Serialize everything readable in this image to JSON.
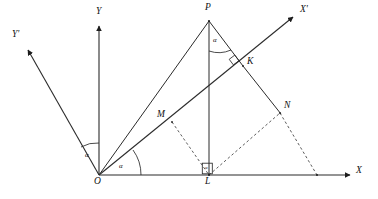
{
  "figure": {
    "type": "geometry-diagram",
    "background_color": "#ffffff",
    "line_color": "#2b2b2b",
    "dashed_color": "#4a4a4a"
  },
  "axes": [
    {
      "id": "x-axis",
      "label": "X",
      "from": [
        99,
        175
      ],
      "to": [
        352,
        175
      ]
    },
    {
      "id": "y-axis",
      "label": "Y",
      "from": [
        99,
        175
      ],
      "to": [
        99,
        24
      ]
    },
    {
      "id": "x-prime-axis",
      "label": "X'",
      "from": [
        99,
        175
      ],
      "to": [
        294,
        16
      ]
    },
    {
      "id": "y-prime-axis",
      "label": "Y'",
      "from": [
        99,
        175
      ],
      "to": [
        27,
        49
      ]
    }
  ],
  "axis_labels": [
    {
      "name": "x-axis-label",
      "text": "X",
      "x": 356,
      "y": 167
    },
    {
      "name": "y-axis-label",
      "text": "Y",
      "x": 96,
      "y": 8
    },
    {
      "name": "x-prime-axis-label",
      "text": "X'",
      "x": 300,
      "y": 6
    },
    {
      "name": "y-prime-axis-label",
      "text": "Y'",
      "x": 12,
      "y": 31
    }
  ],
  "points": [
    {
      "name": "point-O",
      "label": "O",
      "x": 99,
      "y": 175,
      "label_x": 94,
      "label_y": 177
    },
    {
      "name": "point-P",
      "label": "P",
      "x": 209,
      "y": 21,
      "label_x": 205,
      "label_y": 5
    },
    {
      "name": "point-L",
      "label": "L",
      "x": 209,
      "y": 175,
      "label_x": 205,
      "label_y": 177
    },
    {
      "name": "point-M",
      "label": "M",
      "x": 172,
      "y": 122,
      "label_x": 158,
      "label_y": 111
    },
    {
      "name": "point-K",
      "label": "K",
      "x": 243,
      "y": 66,
      "label_x": 247,
      "label_y": 58
    },
    {
      "name": "point-N",
      "label": "N",
      "x": 280,
      "y": 113,
      "label_x": 284,
      "label_y": 102
    }
  ],
  "solid_segments": [
    {
      "name": "segment-OP",
      "from": [
        99,
        175
      ],
      "to": [
        209,
        21
      ]
    },
    {
      "name": "segment-PL",
      "from": [
        209,
        21
      ],
      "to": [
        209,
        175
      ]
    },
    {
      "name": "segment-PK",
      "from": [
        209,
        21
      ],
      "to": [
        243,
        66
      ]
    },
    {
      "name": "segment-KN",
      "from": [
        243,
        66
      ],
      "to": [
        280,
        113
      ]
    }
  ],
  "dashed_segments": [
    {
      "name": "segment-ML",
      "from": [
        172,
        122
      ],
      "to": [
        209,
        175
      ]
    },
    {
      "name": "segment-LN",
      "from": [
        209,
        175
      ],
      "to": [
        280,
        113
      ]
    },
    {
      "name": "segment-NX",
      "from": [
        280,
        113
      ],
      "to": [
        317,
        175
      ]
    }
  ],
  "angles": [
    {
      "name": "angle-alpha-between-Y-and-Yprime",
      "symbol": "α",
      "vertex": [
        99,
        175
      ],
      "label_x": 85,
      "label_y": 153
    },
    {
      "name": "angle-alpha-between-X-and-Xprime",
      "symbol": "α",
      "vertex": [
        99,
        175
      ],
      "label_x": 119,
      "label_y": 164
    },
    {
      "name": "angle-alpha-at-P",
      "symbol": "α",
      "vertex": [
        209,
        21
      ],
      "label_x": 213,
      "label_y": 38
    },
    {
      "name": "angle-alpha-at-L",
      "symbol": "α",
      "vertex": [
        209,
        175
      ],
      "label_x": 204,
      "label_y": 165
    }
  ],
  "right_angle_markers": [
    {
      "name": "right-angle-marker-at-K",
      "x": 232,
      "y": 62
    },
    {
      "name": "right-angle-marker-at-L",
      "x": 203,
      "y": 164
    }
  ]
}
